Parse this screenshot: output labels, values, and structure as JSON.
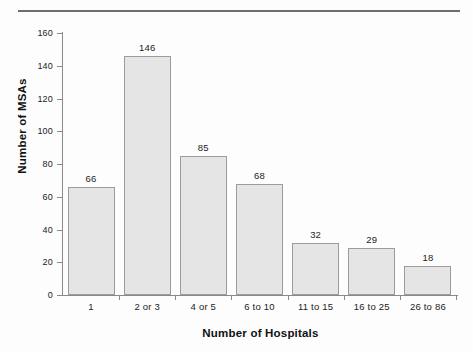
{
  "chart_data": {
    "type": "bar",
    "title": "",
    "xlabel": "Number of Hospitals",
    "ylabel": "Number of MSAs",
    "categories": [
      "1",
      "2 or 3",
      "4 or 5",
      "6 to 10",
      "11 to 15",
      "16 to 25",
      "26 to 86"
    ],
    "values": [
      66,
      146,
      85,
      68,
      32,
      29,
      18
    ],
    "value_labels": [
      "66",
      "146",
      "85",
      "68",
      "32",
      "29",
      "18"
    ],
    "ylim": [
      0,
      160
    ],
    "y_ticks": [
      0,
      20,
      40,
      60,
      80,
      100,
      120,
      140,
      160
    ],
    "y_tick_labels": [
      "0",
      "20",
      "40",
      "60",
      "80",
      "100",
      "120",
      "140",
      "160"
    ],
    "grid": false,
    "legend": "none",
    "bar_fill": "#e5e5e5",
    "bar_border": "#9c9c9c",
    "axis_color": "#8a8a8a",
    "text_color": "#1c1c1c",
    "background": "#fdfdfd"
  }
}
